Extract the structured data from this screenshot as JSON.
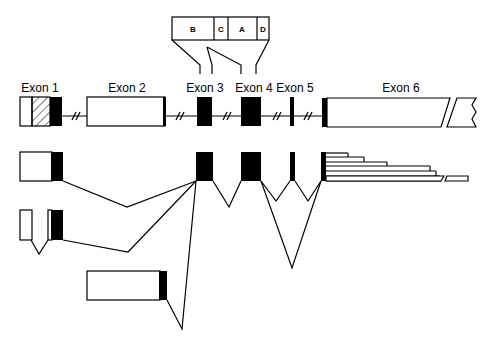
{
  "diagram": {
    "exon_labels": [
      "Exon 1",
      "Exon 2",
      "Exon 3",
      "Exon 4",
      "Exon 5",
      "Exon 6"
    ],
    "domain_labels": [
      "B",
      "C",
      "A",
      "D"
    ],
    "colors": {
      "line": "#000000",
      "background": "#ffffff",
      "coding": "#000000"
    }
  }
}
